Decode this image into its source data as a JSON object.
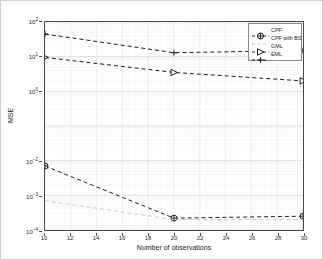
{
  "chart_data": {
    "type": "line",
    "title": "",
    "xlabel": "Number of observations",
    "ylabel": "MSE",
    "xscale": "linear",
    "yscale": "log",
    "xlim": [
      10,
      30
    ],
    "ylim": [
      0.0001,
      100
    ],
    "grid": true,
    "grid_minor": true,
    "legend_position": "upper right",
    "xticks": [
      10,
      12,
      14,
      16,
      18,
      20,
      22,
      24,
      26,
      28,
      30
    ],
    "xticklabels": [
      "10",
      "12",
      "14",
      "16",
      "18",
      "20",
      "22",
      "24",
      "26",
      "28",
      "30"
    ],
    "yticks": [
      0.0001,
      0.001,
      0.01,
      1,
      10,
      100
    ],
    "yticklabels": [
      "10-4",
      "10-3",
      "10-2",
      "100",
      "101",
      "102"
    ],
    "x": [
      10,
      20,
      30
    ],
    "series": [
      {
        "name": "CPF",
        "marker": "circle-plus",
        "linestyle": "dashed",
        "color": "#1a1a1a",
        "values": [
          0.007,
          0.00022,
          0.00025
        ]
      },
      {
        "name": "CPF with BS",
        "marker": "none",
        "linestyle": "dashed",
        "color": "#b9b9b9",
        "values": [
          0.0007,
          0.0002,
          0.0002
        ]
      },
      {
        "name": "GML",
        "marker": "triangle-right",
        "linestyle": "dashed",
        "color": "#1a1a1a",
        "values": [
          9.5,
          3.5,
          2.0
        ]
      },
      {
        "name": "EML",
        "marker": "plus",
        "linestyle": "dashed",
        "color": "#1a1a1a",
        "values": [
          45.0,
          13.0,
          15.0
        ]
      }
    ]
  },
  "legend": {
    "entries": [
      {
        "label": "CPF"
      },
      {
        "label": "CPF with BS"
      },
      {
        "label": "GML"
      },
      {
        "label": "EML"
      }
    ]
  },
  "axes": {
    "x_title": "Number of observations",
    "y_title": "MSE"
  }
}
